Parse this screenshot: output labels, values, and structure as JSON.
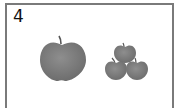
{
  "card": {
    "number": "4",
    "left_group": {
      "label": "big-apple",
      "count": 1
    },
    "right_group": {
      "label": "small-apples",
      "count": 3
    },
    "colors": {
      "border": "#7a7a7a",
      "apple": "#7d7d7d",
      "stem": "#555555"
    }
  }
}
